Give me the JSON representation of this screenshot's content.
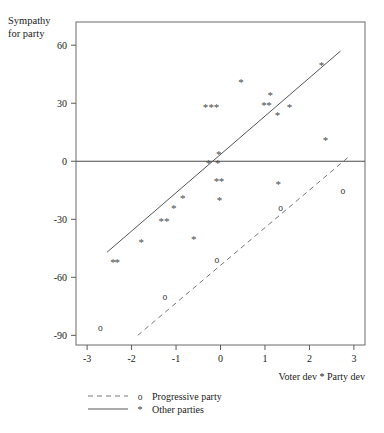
{
  "chart_data": {
    "type": "scatter",
    "title": "",
    "xlabel": "Voter dev * Party dev",
    "ylabel": "Sympathy for party",
    "ylabel_lines": [
      "Sympathy",
      "for party"
    ],
    "xlim": [
      -3.25,
      3.25
    ],
    "ylim": [
      -95,
      72
    ],
    "xticks": [
      -3,
      -2,
      -1,
      0,
      1,
      2,
      3
    ],
    "xticklabels": [
      "-3",
      "-2",
      "-1",
      "0",
      "1",
      "2",
      "3"
    ],
    "yticks": [
      60,
      30,
      0,
      -30,
      -60,
      -90
    ],
    "yticklabels": [
      "60",
      "30",
      "0",
      "-30",
      "-60",
      "-90"
    ],
    "grid": false,
    "zero_line": true,
    "legend_position": "below-left",
    "series": [
      {
        "name": "Other parties",
        "marker": "*",
        "line_style": "solid",
        "points": [
          [
            -2.42,
            -52
          ],
          [
            -2.32,
            -52
          ],
          [
            -1.78,
            -42
          ],
          [
            -1.33,
            -31
          ],
          [
            -1.21,
            -31
          ],
          [
            -1.05,
            -24
          ],
          [
            -0.85,
            -19
          ],
          [
            -0.6,
            -40
          ],
          [
            -0.34,
            28
          ],
          [
            -0.21,
            28
          ],
          [
            -0.09,
            28
          ],
          [
            -0.27,
            -1
          ],
          [
            -0.06,
            -1
          ],
          [
            -0.04,
            4
          ],
          [
            -0.09,
            -10
          ],
          [
            0.02,
            -10
          ],
          [
            -0.02,
            -20
          ],
          [
            0.46,
            41
          ],
          [
            0.98,
            29
          ],
          [
            1.09,
            29
          ],
          [
            1.12,
            34
          ],
          [
            1.28,
            24
          ],
          [
            1.3,
            -12
          ],
          [
            1.55,
            28
          ],
          [
            2.27,
            50
          ],
          [
            2.36,
            11
          ]
        ]
      },
      {
        "name": "Progressive party",
        "marker": "o",
        "line_style": "dashed",
        "points": [
          [
            -2.7,
            -86
          ],
          [
            -1.25,
            -70
          ],
          [
            -0.08,
            -51
          ],
          [
            1.35,
            -24
          ],
          [
            2.75,
            -15
          ]
        ]
      }
    ],
    "fit_lines": [
      {
        "name": "Other parties",
        "style": "solid",
        "x0": -2.55,
        "y0": -47,
        "x1": 2.7,
        "y1": 57
      },
      {
        "name": "Progressive party",
        "style": "dashed",
        "x0": -1.86,
        "y0": -90,
        "x1": 2.92,
        "y1": 3
      }
    ]
  },
  "legend": {
    "entries": [
      {
        "label": "Progressive party",
        "marker": "o",
        "line_style": "dashed"
      },
      {
        "label": "Other parties",
        "marker": "*",
        "line_style": "solid"
      }
    ]
  }
}
